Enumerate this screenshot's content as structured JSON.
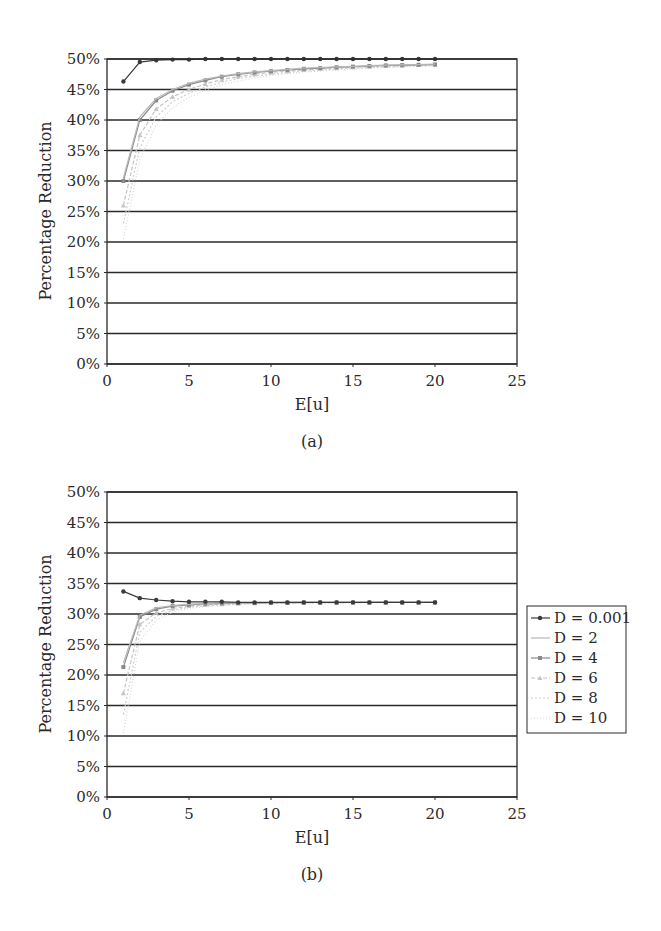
{
  "figure": {
    "panel_labels": [
      "(a)",
      "(b)"
    ]
  },
  "chart_data": [
    {
      "type": "line",
      "panel": "(a)",
      "title": "",
      "xlabel": "E[u]",
      "ylabel": "Percentage Reduction",
      "xlim": [
        0,
        25
      ],
      "ylim": [
        0,
        50
      ],
      "x_ticks": [
        "0",
        "5",
        "10",
        "15",
        "20",
        "25"
      ],
      "y_ticks": [
        "0%",
        "5%",
        "10%",
        "15%",
        "20%",
        "25%",
        "30%",
        "35%",
        "40%",
        "45%",
        "50%"
      ],
      "grid": true,
      "legend_position": "none",
      "x": [
        1,
        2,
        3,
        4,
        5,
        6,
        7,
        8,
        9,
        10,
        11,
        12,
        13,
        14,
        15,
        16,
        17,
        18,
        19,
        20
      ],
      "series": [
        {
          "name": "D = 0.001",
          "values": [
            46.3,
            49.5,
            49.8,
            49.9,
            49.9,
            50,
            50,
            50,
            50,
            50,
            50,
            50,
            50,
            50,
            50,
            50,
            50,
            50,
            50,
            50
          ]
        },
        {
          "name": "D = 2",
          "values": [
            30.5,
            40.5,
            43.5,
            45,
            46,
            46.7,
            47.2,
            47.6,
            47.9,
            48.1,
            48.3,
            48.5,
            48.6,
            48.7,
            48.8,
            48.9,
            49,
            49.05,
            49.1,
            49.15
          ]
        },
        {
          "name": "D = 4",
          "values": [
            30,
            40,
            43.2,
            44.8,
            45.8,
            46.5,
            47.1,
            47.5,
            47.8,
            48,
            48.2,
            48.4,
            48.5,
            48.65,
            48.75,
            48.85,
            48.95,
            49,
            49.05,
            49.1
          ]
        },
        {
          "name": "D = 6",
          "values": [
            26,
            37.5,
            41.8,
            43.8,
            45,
            45.9,
            46.6,
            47.1,
            47.5,
            47.8,
            48,
            48.2,
            48.4,
            48.5,
            48.65,
            48.75,
            48.85,
            48.9,
            49,
            49.05
          ]
        },
        {
          "name": "D = 8",
          "values": [
            23,
            35.5,
            40.5,
            43,
            44.4,
            45.4,
            46.2,
            46.8,
            47.2,
            47.5,
            47.8,
            48,
            48.2,
            48.35,
            48.5,
            48.6,
            48.7,
            48.8,
            48.9,
            48.95
          ]
        },
        {
          "name": "D = 10",
          "values": [
            20.5,
            33.5,
            39.2,
            42,
            43.7,
            44.9,
            45.8,
            46.4,
            46.9,
            47.3,
            47.6,
            47.85,
            48.05,
            48.2,
            48.35,
            48.5,
            48.6,
            48.7,
            48.8,
            48.85
          ]
        }
      ]
    },
    {
      "type": "line",
      "panel": "(b)",
      "title": "",
      "xlabel": "E[u]",
      "ylabel": "Percentage Reduction",
      "xlim": [
        0,
        25
      ],
      "ylim": [
        0,
        50
      ],
      "x_ticks": [
        "0",
        "5",
        "10",
        "15",
        "20",
        "25"
      ],
      "y_ticks": [
        "0%",
        "5%",
        "10%",
        "15%",
        "20%",
        "25%",
        "30%",
        "35%",
        "40%",
        "45%",
        "50%"
      ],
      "grid": true,
      "legend_position": "right",
      "legend": [
        "D = 0.001",
        "D = 2",
        "D = 4",
        "D = 6",
        "D = 8",
        "D = 10"
      ],
      "x": [
        1,
        2,
        3,
        4,
        5,
        6,
        7,
        8,
        9,
        10,
        11,
        12,
        13,
        14,
        15,
        16,
        17,
        18,
        19,
        20
      ],
      "series": [
        {
          "name": "D = 0.001",
          "values": [
            33.7,
            32.6,
            32.3,
            32.1,
            32,
            32,
            32,
            31.9,
            31.9,
            31.9,
            31.9,
            31.9,
            31.9,
            31.9,
            31.9,
            31.9,
            31.9,
            31.9,
            31.9,
            31.9
          ]
        },
        {
          "name": "D = 2",
          "values": [
            22,
            29.8,
            31,
            31.4,
            31.6,
            31.7,
            31.8,
            31.8,
            31.85,
            31.85,
            31.9,
            31.9,
            31.9,
            31.9,
            31.9,
            31.9,
            31.9,
            31.9,
            31.9,
            31.9
          ]
        },
        {
          "name": "D = 4",
          "values": [
            21.3,
            29.5,
            30.8,
            31.3,
            31.5,
            31.65,
            31.75,
            31.8,
            31.8,
            31.85,
            31.85,
            31.9,
            31.9,
            31.9,
            31.9,
            31.9,
            31.9,
            31.9,
            31.9,
            31.9
          ]
        },
        {
          "name": "D = 6",
          "values": [
            17,
            28.3,
            30.2,
            30.9,
            31.3,
            31.5,
            31.6,
            31.7,
            31.75,
            31.8,
            31.8,
            31.85,
            31.85,
            31.85,
            31.9,
            31.9,
            31.9,
            31.9,
            31.9,
            31.9
          ]
        },
        {
          "name": "D = 8",
          "values": [
            13.5,
            27,
            29.6,
            30.6,
            31.1,
            31.35,
            31.5,
            31.6,
            31.7,
            31.75,
            31.8,
            31.8,
            31.85,
            31.85,
            31.85,
            31.9,
            31.9,
            31.9,
            31.9,
            31.9
          ]
        },
        {
          "name": "D = 10",
          "values": [
            10.5,
            25.5,
            29,
            30.3,
            30.9,
            31.2,
            31.4,
            31.55,
            31.65,
            31.7,
            31.75,
            31.8,
            31.8,
            31.85,
            31.85,
            31.85,
            31.9,
            31.9,
            31.9,
            31.9
          ]
        }
      ]
    }
  ],
  "styles": {
    "series_colors": [
      "#3a3a3a",
      "#b8b8b8",
      "#8a8a8a",
      "#c4c4c4",
      "#cfcfcf",
      "#d8d8d8"
    ],
    "series_markers": [
      "circle",
      "none",
      "square",
      "triangle",
      "none",
      "none"
    ],
    "series_dash": [
      "",
      "",
      "",
      "4,2",
      "2,2",
      "1,2"
    ],
    "grid_color": "#2a2a2a",
    "axis_color": "#2a2a2a"
  }
}
